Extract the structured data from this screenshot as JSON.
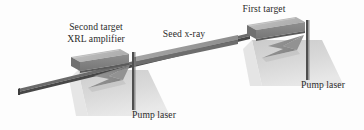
{
  "figure": {
    "background_color": "#fdfdfd",
    "text_color": "#2b2b2b",
    "labels": {
      "second_target_line1": "Second target",
      "second_target_line2": "XRL amplifier",
      "seed_xray": "Seed x-ray",
      "first_target": "First target",
      "pump_laser_right": "Pump laser",
      "pump_laser_left": "Pump laser"
    },
    "colors": {
      "beam_line": "#5c5c5c",
      "beam_line_dark": "#3f3f3f",
      "seed_beam_top": "#9a9a9a",
      "seed_beam_front": "#6f6f6f",
      "target_top": "#b9b9b9",
      "target_front": "#8a8a8a",
      "target_side": "#6e6e6e",
      "ground_plane": "#cfcfcf",
      "ground_plane_light": "#dcdcdc",
      "arrow": "#8f8f8f",
      "arrow_dark": "#7a7a7a",
      "pump_beam": "#565656"
    },
    "elements": {
      "first_target_name": "first-target-slab",
      "second_target_name": "second-target-slab",
      "seed_beam_name": "seed-xray-beam",
      "pump_beam_right_name": "pump-laser-beam-right",
      "pump_beam_left_name": "pump-laser-beam-left",
      "arrow_right_name": "pump-arrow-right",
      "arrow_left_name": "pump-arrow-left"
    }
  }
}
